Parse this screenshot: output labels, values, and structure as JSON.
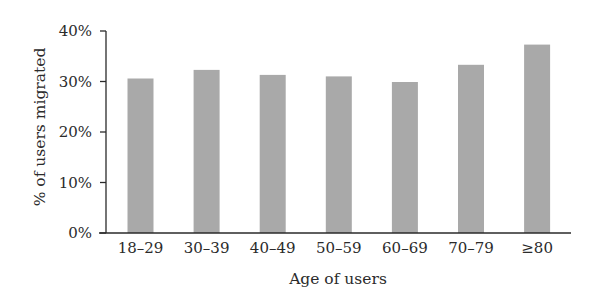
{
  "chart_data": {
    "type": "bar",
    "title": "",
    "xlabel": "Age of users",
    "ylabel": "% of users migrated",
    "categories": [
      "18–29",
      "30–39",
      "40–49",
      "50–59",
      "60–69",
      "70–79",
      "≥80"
    ],
    "values": [
      30.6,
      32.3,
      31.3,
      31.0,
      29.9,
      33.3,
      37.3
    ],
    "value_unit": "%",
    "ylim": [
      0,
      40
    ],
    "yticks": [
      0,
      10,
      20,
      30,
      40
    ],
    "ytick_labels": [
      "0%",
      "10%",
      "20%",
      "30%",
      "40%"
    ],
    "grid": false,
    "legend": null,
    "bar_color": "#a9a9a9",
    "axis_color": "#2a2a2a"
  }
}
